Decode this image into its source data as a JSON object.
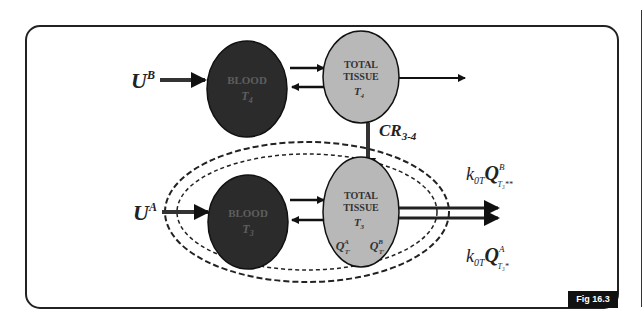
{
  "figure": {
    "tag": "Fig 16.3",
    "colors": {
      "blood_fill": "#2b2b2b",
      "tissue_fill": "#b8b8b8",
      "stroke": "#1a1a1a",
      "frame": "#222222",
      "label_on_dark": "#6a6a6a"
    }
  },
  "top_system": {
    "input_label": "U",
    "input_sup": "B",
    "blood": {
      "name": "BLOOD",
      "compartment": "T",
      "compartment_sub": "4"
    },
    "tissue": {
      "line1": "TOTAL",
      "line2": "TISSUE",
      "compartment": "T",
      "compartment_sub": "4"
    }
  },
  "conversion": {
    "label": "CR",
    "sub": "3-4"
  },
  "bottom_system": {
    "input_label": "U",
    "input_sup": "A",
    "blood": {
      "name": "BLOOD",
      "compartment": "T",
      "compartment_sub": "3"
    },
    "tissue": {
      "line1": "TOTAL",
      "line2": "TISSUE",
      "compartment": "T",
      "compartment_sub": "3",
      "pools": [
        {
          "q": "Q",
          "sup": "A",
          "sub": "T′"
        },
        {
          "q": "Q",
          "sup": "B",
          "sub": "T′"
        }
      ]
    }
  },
  "outputs": [
    {
      "k": "k",
      "k_sub": "0T",
      "q": "Q",
      "sup": "B",
      "sub": "T₃**"
    },
    {
      "k": "k",
      "k_sub": "0T",
      "q": "Q",
      "sup": "A",
      "sub": "T₃*"
    }
  ]
}
